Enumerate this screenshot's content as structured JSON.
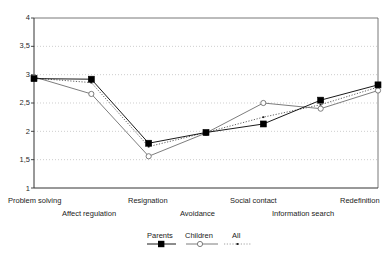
{
  "chart_data": {
    "type": "line",
    "title": "",
    "subtitle": "",
    "xlabel": "",
    "ylabel": "",
    "ylim": [
      1,
      4
    ],
    "yticks": [
      "1",
      "1,5",
      "2",
      "2,5",
      "3",
      "3,5",
      "4"
    ],
    "ytick_values": [
      1,
      1.5,
      2,
      2.5,
      3,
      3.5,
      4
    ],
    "grid": true,
    "grid_style": "dotted-horizontal",
    "legend_position": "bottom",
    "categories": [
      "Problem solving",
      "Affect regulation",
      "Resignation",
      "Avoidance",
      "Social contact",
      "Information search",
      "Redefinition"
    ],
    "category_rows": [
      0,
      1,
      0,
      1,
      0,
      1,
      0
    ],
    "series": [
      {
        "name": "Parents",
        "marker": "filled-square",
        "line": "solid",
        "color": "#000000",
        "values": [
          2.93,
          2.92,
          1.79,
          1.98,
          2.13,
          2.55,
          2.82
        ]
      },
      {
        "name": "Children",
        "marker": "open-circle",
        "line": "solid",
        "color": "#6e6e6e",
        "values": [
          2.96,
          2.66,
          1.56,
          1.97,
          2.5,
          2.4,
          2.72
        ]
      },
      {
        "name": "All",
        "marker": "small-dot",
        "line": "dotted",
        "color": "#3a3a3a",
        "values": [
          2.94,
          2.86,
          1.73,
          1.98,
          2.25,
          2.47,
          2.78
        ]
      }
    ]
  },
  "axis": {
    "y_ticks": [
      "4",
      "3,5",
      "3",
      "2,5",
      "2",
      "1,5",
      "1"
    ]
  },
  "legend": {
    "items": [
      {
        "label": "Parents"
      },
      {
        "label": "Children"
      },
      {
        "label": "All"
      }
    ]
  }
}
